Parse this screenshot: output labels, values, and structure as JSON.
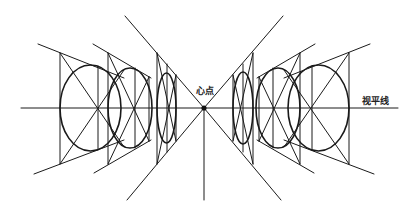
{
  "diagram": {
    "labels": {
      "center_point": "心点",
      "horizon_line": "视平线"
    },
    "colors": {
      "line": "#1a1a1a",
      "background": "#ffffff"
    },
    "center_point": {
      "x": 204,
      "y": 108
    },
    "horizon": {
      "y": 108,
      "x_start": 21,
      "x_end": 398
    },
    "units": [
      {
        "side": "left",
        "name": "large",
        "left": 60,
        "mid": 98,
        "right": 136,
        "top_left": 53,
        "bottom_left": 164,
        "ellipse": {
          "cx": 90.5,
          "cy": 108,
          "rx": 30.5,
          "ry": 43
        }
      },
      {
        "side": "left",
        "name": "medium",
        "left": 108,
        "mid": 135,
        "right": 149,
        "top_left": 53,
        "bottom_left": 163,
        "ellipse": {
          "cx": 130,
          "cy": 108,
          "rx": 22,
          "ry": 40
        }
      },
      {
        "side": "left",
        "name": "small",
        "left": 157,
        "mid": 167,
        "right": 176,
        "top_left": 53,
        "bottom_left": 163,
        "ellipse": {
          "cx": 166.5,
          "cy": 108,
          "rx": 9.5,
          "ry": 35
        }
      },
      {
        "side": "right",
        "name": "small",
        "left": 233,
        "mid": 243,
        "right": 253
      },
      {
        "side": "right",
        "name": "medium",
        "left": 259,
        "mid": 273,
        "right": 300
      },
      {
        "side": "right",
        "name": "large",
        "left": 288,
        "mid": 312,
        "right": 349
      }
    ]
  }
}
